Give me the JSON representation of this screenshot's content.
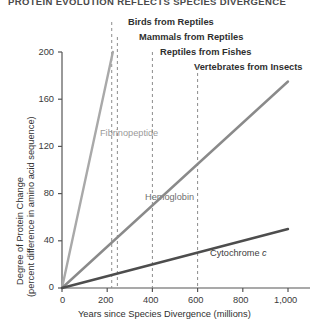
{
  "chart_data": {
    "type": "line",
    "title": "PROTEIN EVOLUTION REFLECTS SPECIES DIVERGENCE",
    "xlabel": "Years since Species Divergence (millions)",
    "ylabel_line1": "Degree of Protein Change",
    "ylabel_line2": "(percent difference in amino acid sequence)",
    "xlim": [
      0,
      1000
    ],
    "ylim": [
      0,
      200
    ],
    "xticks": [
      0,
      200,
      400,
      600,
      800,
      1000
    ],
    "xticklabels": [
      "0",
      "200",
      "400",
      "600",
      "800",
      "1,000"
    ],
    "yticks": [
      0,
      40,
      80,
      120,
      160,
      200
    ],
    "yticklabels": [
      "0",
      "40",
      "80",
      "120",
      "160",
      "200"
    ],
    "grid": false,
    "legend": "inline-labels",
    "series": [
      {
        "name": "Fibrinopeptide",
        "color": "#a9a9a9",
        "x": [
          0,
          225
        ],
        "values": [
          0,
          200
        ]
      },
      {
        "name": "Hemoglobin",
        "color": "#8a8a8a",
        "x": [
          0,
          1000
        ],
        "values": [
          0,
          175
        ]
      },
      {
        "name": "Cytochrome c",
        "color": "#4d4d4d",
        "x": [
          0,
          1000
        ],
        "values": [
          0,
          50
        ]
      }
    ],
    "annotations": [
      {
        "label": "Birds from Reptiles",
        "x": 220
      },
      {
        "label": "Mammals from Reptiles",
        "x": 245
      },
      {
        "label": "Reptiles from Fishes",
        "x": 400
      },
      {
        "label": "Vertebrates from Insects",
        "x": 600
      }
    ]
  },
  "series_labels": {
    "fibrinopeptide": "Fibrinopeptide",
    "hemoglobin": "Hemoglobin",
    "cytochrome_base": "Cytochrome",
    "cytochrome_italic": "c"
  }
}
